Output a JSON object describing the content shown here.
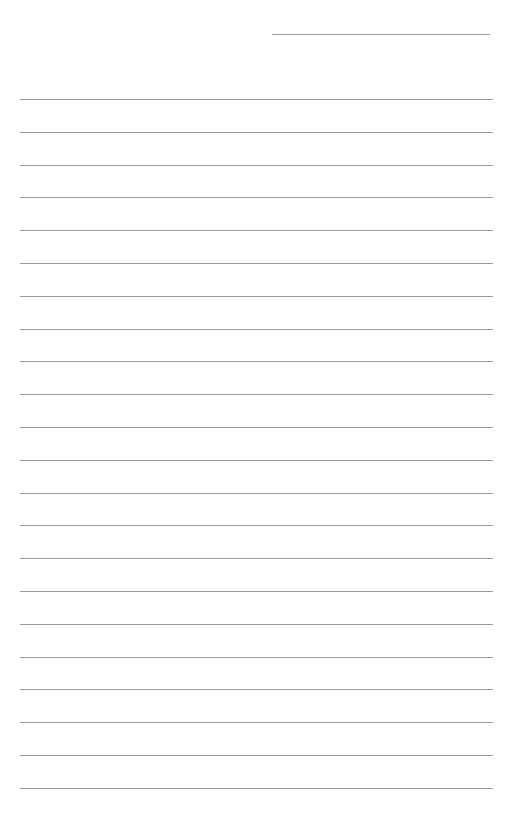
{
  "page": {
    "type": "lined-paper",
    "background": "#ffffff",
    "line_color": "#9a9a9a",
    "header_line": {
      "x": 272,
      "y": 34,
      "width": 218
    },
    "rules": {
      "count": 22,
      "x": 20,
      "width": 473,
      "first_y": 99,
      "spacing": 32.8
    }
  }
}
